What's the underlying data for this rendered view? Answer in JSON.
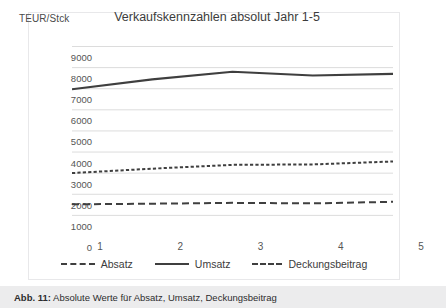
{
  "figure": {
    "caption_prefix": "Abb. 11:",
    "caption_text": " Absolute Werte für Absatz, Umsatz, Deckungsbeitrag"
  },
  "chart_data": {
    "type": "line",
    "title": "Verkaufskennzahlen absolut Jahr 1-5",
    "xlabel": "",
    "ylabel": "TEUR/Stck",
    "categories": [
      "1",
      "2",
      "3",
      "4",
      "5"
    ],
    "x": [
      1,
      2,
      3,
      4,
      5
    ],
    "ylim": [
      0,
      9000
    ],
    "yticks": [
      "9000",
      "8000",
      "7000",
      "6000",
      "5000",
      "4000",
      "3000",
      "2000",
      "1000",
      "0"
    ],
    "ytick_values": [
      9000,
      8000,
      7000,
      6000,
      5000,
      4000,
      3000,
      2000,
      1000,
      0
    ],
    "grid": true,
    "legend_position": "bottom",
    "series": [
      {
        "name": "Absatz",
        "style": "dashed-long",
        "color": "#3f3f3f",
        "values": [
          1500,
          1530,
          1570,
          1545,
          1620
        ]
      },
      {
        "name": "Umsatz",
        "style": "solid",
        "color": "#3f3f3f",
        "values": [
          6950,
          7420,
          7780,
          7600,
          7680
        ]
      },
      {
        "name": "Deckungsbeitrag",
        "style": "dashed-short",
        "color": "#3f3f3f",
        "values": [
          2980,
          3190,
          3370,
          3390,
          3530
        ]
      }
    ]
  }
}
